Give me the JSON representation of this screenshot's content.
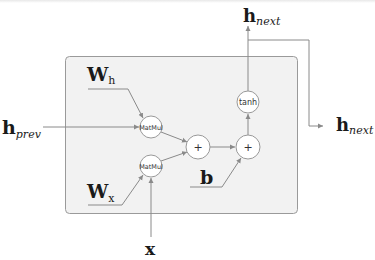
{
  "diagram": {
    "box": {
      "fill": "#f2f2f2",
      "stroke": "#9a9a9a"
    },
    "colors": {
      "line": "#8a8a8a",
      "node_fill": "#ffffff",
      "node_stroke": "#999999",
      "text": "#1a1a1a"
    },
    "inputs": {
      "h_prev": {
        "main": "h",
        "sub": "prev"
      },
      "x": {
        "main": "x"
      },
      "W_h": {
        "main": "W",
        "sub": "h"
      },
      "W_x": {
        "main": "W",
        "sub": "x"
      },
      "b": {
        "main": "b"
      }
    },
    "outputs": {
      "h_next_top": {
        "main": "h",
        "sub": "next"
      },
      "h_next_right": {
        "main": "h",
        "sub": "next"
      }
    },
    "nodes": [
      {
        "id": "matmul_h",
        "label": "MatMul"
      },
      {
        "id": "matmul_x",
        "label": "MatMul"
      },
      {
        "id": "add_1",
        "label": "+"
      },
      {
        "id": "add_2",
        "label": "+"
      },
      {
        "id": "tanh",
        "label": "tanh"
      }
    ],
    "edges": [
      [
        "W_h",
        "matmul_h"
      ],
      [
        "h_prev",
        "matmul_h"
      ],
      [
        "W_x",
        "matmul_x"
      ],
      [
        "x",
        "matmul_x"
      ],
      [
        "matmul_h",
        "add_1"
      ],
      [
        "matmul_x",
        "add_1"
      ],
      [
        "add_1",
        "add_2"
      ],
      [
        "b",
        "add_2"
      ],
      [
        "add_2",
        "tanh"
      ],
      [
        "tanh",
        "h_next_top"
      ],
      [
        "tanh",
        "h_next_right"
      ]
    ]
  }
}
